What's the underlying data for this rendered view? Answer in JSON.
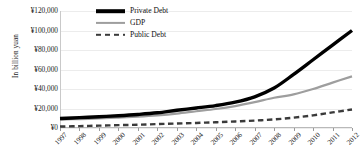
{
  "chart_data": {
    "type": "line",
    "title": "",
    "xlabel": "",
    "ylabel": "In billion yuan",
    "ylim": [
      0,
      120000
    ],
    "ytick_step": 20000,
    "grid": true,
    "legend_position": "top-center",
    "x": [
      1997,
      1998,
      1999,
      2000,
      2001,
      2002,
      2003,
      2004,
      2005,
      2006,
      2007,
      2008,
      2009,
      2010,
      2011,
      2012
    ],
    "x_tick_labels": [
      "1997",
      "1998",
      "1999",
      "2000",
      "2001",
      "2002",
      "2003",
      "2004",
      "2005",
      "2006",
      "2007",
      "2008",
      "2009",
      "2010",
      "2011",
      "2012"
    ],
    "y_tick_labels": [
      "¥0",
      "¥20,000",
      "¥40,000",
      "¥60,000",
      "¥80,000",
      "¥100,000",
      "¥120,000"
    ],
    "y_tick_values": [
      0,
      20000,
      40000,
      60000,
      80000,
      100000,
      120000
    ],
    "series": [
      {
        "name": "Private Debt",
        "style": "solid",
        "color": "#000000",
        "width": 3.4,
        "values": [
          9800,
          10600,
          11600,
          12600,
          13900,
          15600,
          18200,
          20500,
          23000,
          26500,
          32000,
          41000,
          55000,
          70000,
          85000,
          100000
        ]
      },
      {
        "name": "GDP",
        "style": "solid",
        "color": "#9e9e9e",
        "width": 2.2,
        "values": [
          8600,
          9200,
          9800,
          10700,
          11700,
          13000,
          14800,
          17200,
          19500,
          22500,
          26500,
          31000,
          34500,
          40000,
          46500,
          53000
        ]
      },
      {
        "name": "Public Debt",
        "style": "dashed",
        "color": "#3a3a3a",
        "width": 2.4,
        "values": [
          1500,
          1900,
          2400,
          2900,
          3400,
          4000,
          4600,
          5200,
          5900,
          6700,
          7600,
          8800,
          10600,
          13000,
          16000,
          19000
        ]
      }
    ]
  },
  "legend": {
    "items": [
      {
        "label": "Private Debt"
      },
      {
        "label": "GDP"
      },
      {
        "label": "Public Debt"
      }
    ]
  }
}
